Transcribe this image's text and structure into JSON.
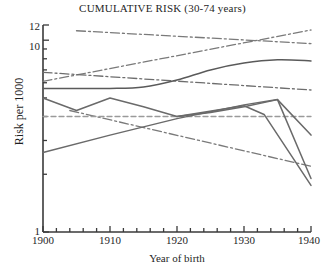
{
  "chart_data": {
    "type": "line",
    "title": "CUMULATIVE RISK (30-74 years)",
    "xlabel": "Year of birth",
    "ylabel": "Risk per 1000",
    "yscale": "log",
    "ylim": [
      1,
      12
    ],
    "xlim": [
      1900,
      1940
    ],
    "grid": false,
    "legend": null,
    "xticks": [
      1900,
      1910,
      1920,
      1930,
      1940
    ],
    "xtick_labels": [
      "1900",
      "1910",
      "1920",
      "1930",
      "1940"
    ],
    "yticks": [
      1,
      2,
      3,
      4,
      5,
      6,
      7,
      8,
      9,
      10,
      12
    ],
    "ytick_labels": [
      "1",
      "",
      "",
      "",
      "",
      "",
      "",
      "",
      "",
      "10",
      "12"
    ],
    "labeled_yticks": [
      "12",
      "10",
      "1"
    ],
    "series": [
      {
        "name": "trend-upper-declining",
        "style": "dash-dot",
        "color": "#7a7a7a",
        "x": [
          1905,
          1940
        ],
        "values": [
          11.2,
          9.6
        ]
      },
      {
        "name": "trend-rising",
        "style": "dash-dot",
        "color": "#7a7a7a",
        "x": [
          1900,
          1940
        ],
        "values": [
          6.1,
          11.3
        ]
      },
      {
        "name": "trend-mid-declining",
        "style": "dash-dot",
        "color": "#6d6d6d",
        "x": [
          1900,
          1940
        ],
        "values": [
          6.8,
          5.5
        ]
      },
      {
        "name": "trend-lower-declining",
        "style": "dash-dot",
        "color": "#7a7a7a",
        "x": [
          1904,
          1940
        ],
        "values": [
          4.3,
          2.2
        ]
      },
      {
        "name": "reference-line",
        "style": "dashed",
        "color": "#9a9a9a",
        "x": [
          1900,
          1940
        ],
        "values": [
          4.0,
          4.0
        ]
      },
      {
        "name": "smooth-rising-curve",
        "style": "solid",
        "color": "#5a5a5a",
        "x": [
          1900,
          1905,
          1910,
          1915,
          1920,
          1925,
          1930,
          1935,
          1940
        ],
        "values": [
          5.6,
          5.6,
          5.6,
          5.7,
          6.2,
          7.0,
          7.6,
          7.9,
          7.8
        ]
      },
      {
        "name": "series-peak-1910",
        "style": "solid",
        "color": "#6a6a6a",
        "x": [
          1900,
          1905,
          1910,
          1915,
          1920,
          1925,
          1930,
          1935,
          1940
        ],
        "values": [
          5.0,
          4.3,
          5.0,
          4.5,
          4.0,
          4.2,
          4.5,
          4.9,
          3.2
        ]
      },
      {
        "name": "series-rising-then-falling",
        "style": "solid",
        "color": "#6a6a6a",
        "x": [
          1900,
          1910,
          1920,
          1930,
          1935,
          1940
        ],
        "values": [
          2.6,
          3.2,
          3.9,
          4.6,
          4.9,
          1.9
        ]
      },
      {
        "name": "series-steep-decline",
        "style": "solid",
        "color": "#6a6a6a",
        "x": [
          1920,
          1930,
          1933,
          1940
        ],
        "values": [
          4.0,
          4.55,
          4.1,
          1.75
        ]
      }
    ]
  },
  "axes": {
    "title_text": "CUMULATIVE RISK (30-74 years)",
    "y_axis_title": "Risk per 1000",
    "x_axis_title": "Year of birth"
  }
}
